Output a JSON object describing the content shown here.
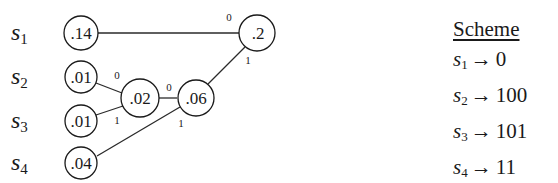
{
  "symbols": [
    {
      "base": "s",
      "sub": "1",
      "prob": ".14",
      "code": "0"
    },
    {
      "base": "s",
      "sub": "2",
      "prob": ".01",
      "code": "100"
    },
    {
      "base": "s",
      "sub": "3",
      "prob": ".01",
      "code": "101"
    },
    {
      "base": "s",
      "sub": "4",
      "prob": ".04",
      "code": "11"
    }
  ],
  "internal_nodes": {
    "n02": ".02",
    "n06": ".06",
    "n2": ".2"
  },
  "edge_labels": {
    "s2_to_n02": "0",
    "s3_to_n02": "1",
    "n02_to_n06": "0",
    "s4_to_n06": "1",
    "s1_to_n2": "0",
    "n06_to_n2": "1"
  },
  "scheme": {
    "title": "Scheme",
    "arrow": "→",
    "rows": [
      {
        "base": "s",
        "sub": "1",
        "code": "0"
      },
      {
        "base": "s",
        "sub": "2",
        "code": "100"
      },
      {
        "base": "s",
        "sub": "3",
        "code": "101"
      },
      {
        "base": "s",
        "sub": "4",
        "code": "11"
      }
    ]
  }
}
